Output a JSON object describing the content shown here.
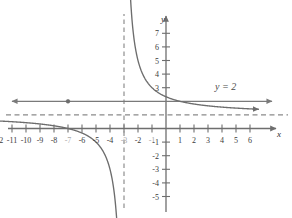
{
  "figure": {
    "title": "",
    "axis_label_x": "x",
    "axis_label_y": "y",
    "annotation_line": "y = 2",
    "colors": {
      "axis": "#6e6e6e",
      "curve": "#6d6d6d",
      "line": "#7a7a7a",
      "asymptote": "#8a8a8a",
      "tick_text": "#3b3b3b",
      "tick_text_dim": "#a9a9a9",
      "background": "#ffffff"
    }
  },
  "chart_data": {
    "type": "line",
    "title": "",
    "xlabel": "x",
    "ylabel": "y",
    "xlim": [
      -13,
      7
    ],
    "ylim": [
      -6,
      8
    ],
    "grid": false,
    "legend": "none",
    "x_ticks": [
      -12,
      -11,
      -10,
      -9,
      -8,
      -7,
      -6,
      -5,
      -4,
      -3,
      -2,
      -1,
      1,
      2,
      3,
      4,
      5,
      6
    ],
    "x_tick_labels": [
      "-12",
      "-11",
      "-10",
      "-9",
      "-8",
      "-7",
      "-6",
      "-5",
      "-4",
      "-3",
      "-2",
      "-1",
      "1",
      "2",
      "3",
      "4",
      "5",
      "6"
    ],
    "x_tick_labels_dim": [
      -7,
      -3,
      -1
    ],
    "y_ticks": [
      7,
      6,
      5,
      4,
      3,
      -1,
      -2,
      -3,
      -4,
      -5
    ],
    "y_tick_labels": [
      "7",
      "6",
      "5",
      "4",
      "3",
      "-1",
      "-2",
      "-3",
      "-4",
      "-5"
    ],
    "series": [
      {
        "name": "rational-curve",
        "expression": "y = 1 + 4/(x + 3)",
        "style": "solid",
        "branches": [
          {
            "name": "left-branch",
            "x_from": -13.0,
            "x_to": -3.35,
            "arrow_start": "left",
            "arrow_end": "up"
          },
          {
            "name": "right-branch",
            "x_from": -2.65,
            "x_to": 6.6,
            "arrow_start": "down",
            "arrow_end": "right"
          }
        ]
      },
      {
        "name": "horizontal-line-y-equals-2",
        "expression": "y = 2",
        "style": "solid",
        "arrow_start": "left",
        "arrow_end": "right",
        "y": 2
      }
    ],
    "asymptotes": [
      {
        "name": "vertical-asymptote",
        "type": "vertical",
        "value": -3,
        "style": "dashed"
      },
      {
        "name": "horizontal-asymptote",
        "type": "horizontal",
        "value": 1,
        "style": "dashed"
      }
    ],
    "points": [
      {
        "name": "intersection-point",
        "x": -7,
        "y": 2,
        "label": ""
      }
    ],
    "annotations": [
      {
        "name": "line-equation-label",
        "text": "y = 2",
        "x": 3.3,
        "y": 2.6
      }
    ]
  },
  "ticks": {
    "x": [
      {
        "v": "-12",
        "px": -12,
        "dim": false
      },
      {
        "v": "-11",
        "px": -11,
        "dim": false
      },
      {
        "v": "-10",
        "px": -10,
        "dim": false
      },
      {
        "v": "-9",
        "px": -9,
        "dim": false
      },
      {
        "v": "-8",
        "px": -8,
        "dim": false
      },
      {
        "v": "-7",
        "px": -7,
        "dim": true
      },
      {
        "v": "-6",
        "px": -6,
        "dim": false
      },
      {
        "v": "-5",
        "px": -5,
        "dim": false
      },
      {
        "v": "-4",
        "px": -4,
        "dim": false
      },
      {
        "v": "-3",
        "px": -3,
        "dim": true
      },
      {
        "v": "-2",
        "px": -2,
        "dim": false
      },
      {
        "v": "-1",
        "px": -1,
        "dim": true
      },
      {
        "v": "1",
        "px": 1,
        "dim": false
      },
      {
        "v": "2",
        "px": 2,
        "dim": false
      },
      {
        "v": "3",
        "px": 3,
        "dim": false
      },
      {
        "v": "4",
        "px": 4,
        "dim": false
      },
      {
        "v": "5",
        "px": 5,
        "dim": false
      },
      {
        "v": "6",
        "px": 6,
        "dim": false
      }
    ],
    "y": [
      {
        "v": "7",
        "py": 7
      },
      {
        "v": "6",
        "py": 6
      },
      {
        "v": "5",
        "py": 5
      },
      {
        "v": "4",
        "py": 4
      },
      {
        "v": "3",
        "py": 3
      },
      {
        "v": "-1",
        "py": -1
      },
      {
        "v": "-2",
        "py": -2
      },
      {
        "v": "-3",
        "py": -3
      },
      {
        "v": "-4",
        "py": -4
      },
      {
        "v": "-5",
        "py": -5
      }
    ]
  }
}
